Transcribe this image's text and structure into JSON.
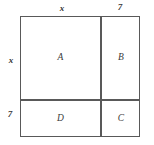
{
  "diagram": {
    "style": {
      "line_color": "#595959",
      "background": "#ffffff",
      "label_color": "#3a3a3a"
    },
    "dimension_labels": {
      "top_left": "x",
      "top_right": "7",
      "left_upper": "x",
      "left_lower": "7"
    },
    "regions": [
      {
        "id": "A",
        "label": "A",
        "position": "top-left"
      },
      {
        "id": "B",
        "label": "B",
        "position": "top-right"
      },
      {
        "id": "C",
        "label": "C",
        "position": "bottom-right"
      },
      {
        "id": "D",
        "label": "D",
        "position": "bottom-left"
      }
    ]
  },
  "chart_data": {
    "type": "diagram",
    "title": "",
    "outer_side_segments": {
      "horizontal": [
        "x",
        "7"
      ],
      "vertical": [
        "x",
        "7"
      ]
    },
    "regions": [
      {
        "label": "A",
        "width": "x",
        "height": "x"
      },
      {
        "label": "B",
        "width": "7",
        "height": "x"
      },
      {
        "label": "C",
        "width": "7",
        "height": "7"
      },
      {
        "label": "D",
        "width": "x",
        "height": "7"
      }
    ]
  }
}
